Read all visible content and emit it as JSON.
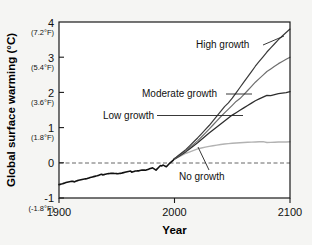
{
  "chart_data": {
    "type": "line",
    "title": "",
    "xlabel": "Year",
    "ylabel": "Global surface warming (°C)",
    "xlim": [
      1900,
      2100
    ],
    "ylim": [
      -1,
      4
    ],
    "grid": false,
    "legend_position": "inline-annotations",
    "xticks": [
      1900,
      2000,
      2100
    ],
    "xtick_labels": [
      "1900",
      "2000",
      "2100"
    ],
    "yticks": [
      -1,
      0,
      1,
      2,
      3,
      4
    ],
    "ytick_labels": [
      "-1",
      "0",
      "1",
      "2",
      "3",
      "4"
    ],
    "ytick_sublabels": [
      "(-1.8°F)",
      "",
      "(1.8°F)",
      "(3.6°F)",
      "(5.4°F)",
      "(7.2°F)"
    ],
    "reference_line": {
      "y": 0,
      "style": "dashed"
    },
    "series": [
      {
        "name": "Historical observations",
        "color": "#111111",
        "x": [
          1900,
          1903,
          1906,
          1909,
          1912,
          1915,
          1918,
          1921,
          1924,
          1927,
          1930,
          1933,
          1936,
          1939,
          1942,
          1945,
          1948,
          1951,
          1954,
          1957,
          1960,
          1963,
          1966,
          1969,
          1972,
          1975,
          1978,
          1981,
          1984,
          1987,
          1990,
          1993,
          1996,
          1999,
          2000
        ],
        "values": [
          -0.62,
          -0.6,
          -0.57,
          -0.55,
          -0.54,
          -0.5,
          -0.48,
          -0.46,
          -0.45,
          -0.42,
          -0.4,
          -0.38,
          -0.35,
          -0.32,
          -0.3,
          -0.29,
          -0.3,
          -0.31,
          -0.3,
          -0.28,
          -0.26,
          -0.25,
          -0.22,
          -0.22,
          -0.2,
          -0.21,
          -0.18,
          -0.15,
          -0.22,
          -0.12,
          -0.05,
          -0.1,
          0.0,
          0.08,
          0.12
        ]
      },
      {
        "name": "High growth",
        "color": "#3a3a3a",
        "x": [
          2000,
          2010,
          2020,
          2030,
          2040,
          2050,
          2060,
          2070,
          2080,
          2090,
          2100
        ],
        "values": [
          0.12,
          0.38,
          0.7,
          1.05,
          1.45,
          1.85,
          2.3,
          2.75,
          3.15,
          3.5,
          3.8
        ]
      },
      {
        "name": "Moderate growth",
        "color": "#6e6e6e",
        "x": [
          2000,
          2010,
          2020,
          2030,
          2040,
          2050,
          2060,
          2070,
          2080,
          2090,
          2100
        ],
        "values": [
          0.12,
          0.35,
          0.62,
          0.95,
          1.3,
          1.62,
          1.95,
          2.3,
          2.6,
          2.82,
          3.0
        ]
      },
      {
        "name": "Low growth",
        "color": "#2e2e2e",
        "x": [
          2000,
          2010,
          2020,
          2030,
          2040,
          2050,
          2060,
          2070,
          2080,
          2090,
          2100
        ],
        "values": [
          0.12,
          0.33,
          0.58,
          0.85,
          1.1,
          1.35,
          1.55,
          1.75,
          1.9,
          1.98,
          2.02
        ]
      },
      {
        "name": "No growth",
        "color": "#b2b2b2",
        "x": [
          2000,
          2010,
          2020,
          2030,
          2040,
          2050,
          2060,
          2070,
          2080,
          2090,
          2100
        ],
        "values": [
          0.12,
          0.28,
          0.4,
          0.47,
          0.52,
          0.55,
          0.57,
          0.58,
          0.59,
          0.6,
          0.6
        ]
      }
    ],
    "annotations": [
      {
        "text": "High growth",
        "x": 2045,
        "y": 3.05
      },
      {
        "text": "Moderate growth",
        "x": 2010,
        "y": 1.9
      },
      {
        "text": "Low growth",
        "x": 1975,
        "y": 1.28
      },
      {
        "text": "No growth",
        "x": 2035,
        "y": -0.45
      }
    ]
  },
  "axes": {
    "x_title": "Year",
    "y_title": "Global surface warming (°C)",
    "x_ticks": [
      {
        "label": "1900"
      },
      {
        "label": "2000"
      },
      {
        "label": "2100"
      }
    ],
    "y_ticks": [
      {
        "label": "4",
        "sub": "(7.2°F)"
      },
      {
        "label": "3",
        "sub": "(5.4°F)"
      },
      {
        "label": "2",
        "sub": "(3.6°F)"
      },
      {
        "label": "1",
        "sub": "(1.8°F)"
      },
      {
        "label": "0",
        "sub": ""
      },
      {
        "label": "-1",
        "sub": "(-1.8°F)"
      }
    ]
  },
  "labels": {
    "high_growth": "High growth",
    "moderate_growth": "Moderate growth",
    "low_growth": "Low growth",
    "no_growth": "No growth"
  },
  "colors": {
    "frame": "#1a1a1a",
    "historical": "#111111",
    "high": "#3a3a3a",
    "moderate": "#6e6e6e",
    "low": "#2e2e2e",
    "no_growth": "#b2b2b2",
    "background": "#f5f5f3"
  }
}
